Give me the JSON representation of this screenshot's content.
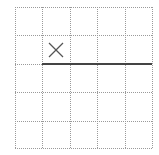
{
  "grid": {
    "rows": 5,
    "cols": 5,
    "x_lines": [
      15,
      42,
      70,
      97,
      125,
      152
    ],
    "y_lines": [
      7,
      35,
      64,
      92,
      121,
      148
    ],
    "line_color": "#9a9a9a",
    "line_style": "dotted"
  },
  "marker": {
    "type": "x-mark",
    "cell_row": 2,
    "cell_col": 2,
    "center": [
      56,
      50
    ],
    "half_size": 7,
    "color": "#555555"
  },
  "segment": {
    "type": "solid-line",
    "x1": 42,
    "y1": 64,
    "x2": 152,
    "y2": 64,
    "color": "#444444",
    "width": 2
  }
}
